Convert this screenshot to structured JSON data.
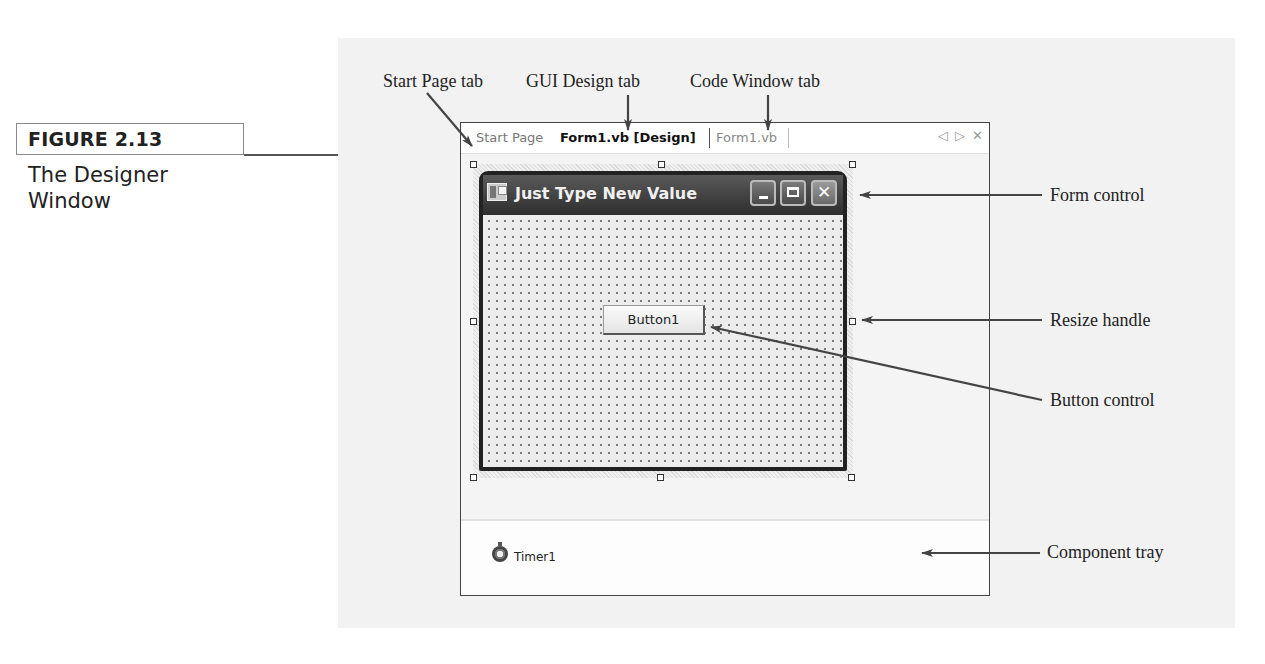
{
  "figure": {
    "number_label": "FIGURE 2.13",
    "caption_line1": "The Designer",
    "caption_line2": "Window"
  },
  "callouts": {
    "start_page_tab": "Start Page tab",
    "gui_design_tab": "GUI Design tab",
    "code_window_tab": "Code Window tab",
    "form_control": "Form control",
    "resize_handle": "Resize handle",
    "button_control": "Button control",
    "component_tray": "Component tray"
  },
  "ide": {
    "tabs": [
      {
        "label": "Start Page",
        "active": false
      },
      {
        "label": "Form1.vb [Design]",
        "active": true
      },
      {
        "label": "Form1.vb",
        "active": false
      }
    ],
    "tab_controls": {
      "scroll_left_icon": "◁",
      "scroll_right_icon": "▷",
      "close_icon": "✕"
    }
  },
  "form": {
    "title": "Just Type New Value",
    "caption_buttons": [
      "minimize",
      "maximize",
      "close"
    ],
    "close_glyph": "✕",
    "button_label": "Button1"
  },
  "component_tray": {
    "items": [
      {
        "icon": "stopwatch-icon",
        "label": "Timer1"
      }
    ]
  },
  "colors": {
    "panel_bg": "#f2f2f2",
    "form_title_bar": "#3a3a3a",
    "arrow": "#444444"
  }
}
